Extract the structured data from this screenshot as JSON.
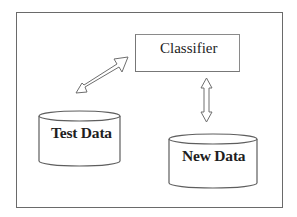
{
  "diagram": {
    "type": "block-flow",
    "nodes": [
      {
        "id": "classifier",
        "label": "Classifier",
        "shape": "rectangle"
      },
      {
        "id": "test_data",
        "label": "Test Data",
        "shape": "cylinder"
      },
      {
        "id": "new_data",
        "label": "New Data",
        "shape": "cylinder"
      }
    ],
    "edges": [
      {
        "from": "test_data",
        "to": "classifier",
        "style": "double-headed hollow arrow",
        "direction": "bidirectional"
      },
      {
        "from": "classifier",
        "to": "new_data",
        "style": "double-headed hollow arrow",
        "direction": "bidirectional"
      }
    ]
  },
  "colors": {
    "stroke": "#6a6a6a",
    "text": "#1e1e1e",
    "background": "#ffffff"
  }
}
